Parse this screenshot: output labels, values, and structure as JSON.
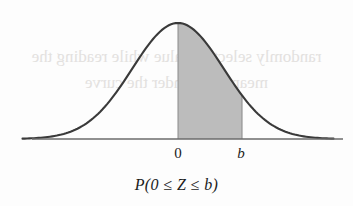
{
  "figure": {
    "name": "standard-normal-distribution-shaded-area",
    "caption": "P(0 ≤ Z ≤ b)",
    "background_color": "#fdfdfd",
    "curve_color": "#3a3a3a",
    "axis_color": "#6b6b6b",
    "shade_color": "#bcbcbc",
    "text_color": "#1b1b1b",
    "axis_labels": {
      "mean": "0",
      "upper_bound": "b"
    },
    "bleed_through": {
      "line1": "randomly selects a value while reading the",
      "line2": "mean Area under the curve"
    }
  },
  "chart_data": {
    "type": "area",
    "title": "",
    "subtitle": "",
    "xlabel": "",
    "ylabel": "",
    "annotations": [
      "0",
      "b",
      "P(0 ≤ Z ≤ b)"
    ],
    "grid": false,
    "legend": "none",
    "axis": {
      "x_baseline_y": 139,
      "x_start_px": 32,
      "x_end_px": 343,
      "xlim": [
        -3.4,
        3.4
      ],
      "ylim": [
        0,
        1
      ]
    },
    "curve": {
      "distribution": "standard normal",
      "mean": 0,
      "sd": 1,
      "peak_px": {
        "x": 178,
        "y": 23
      },
      "x": [
        -3.4,
        -3.0,
        -2.6,
        -2.2,
        -1.8,
        -1.4,
        -1.0,
        -0.6,
        -0.2,
        0.0,
        0.2,
        0.6,
        1.0,
        1.4,
        1.8,
        2.2,
        2.6,
        3.0,
        3.4
      ],
      "y": [
        0.003,
        0.011,
        0.032,
        0.079,
        0.163,
        0.298,
        0.484,
        0.698,
        0.921,
        1.0,
        0.921,
        0.698,
        0.484,
        0.298,
        0.163,
        0.079,
        0.032,
        0.011,
        0.003
      ]
    },
    "shaded_region": {
      "label": "P(0 ≤ Z ≤ b)",
      "from_label": "0",
      "to_label": "b",
      "from_x": 0.0,
      "to_x": 1.4,
      "from_px": 178,
      "to_px": 241,
      "fill": "#bcbcbc"
    }
  }
}
